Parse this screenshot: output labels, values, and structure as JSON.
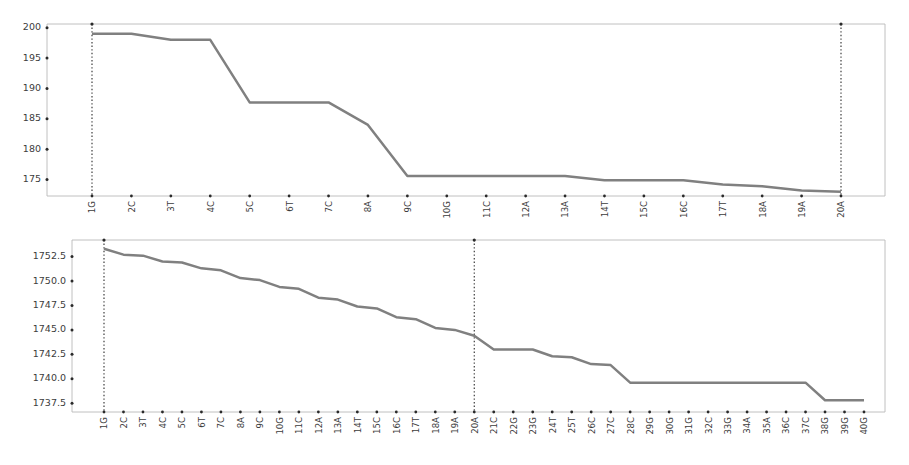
{
  "figure": {
    "background_color": "#ffffff",
    "line_color": "#808080",
    "axis_color": "#b9b9b9",
    "tick_color": "#2a2a2a",
    "marker_line_color": "#2a2a2a"
  },
  "chart_data": [
    {
      "id": "top",
      "type": "line",
      "title": "",
      "xlabel": "",
      "ylabel": "",
      "grid": false,
      "legend": null,
      "ylim": [
        172.3,
        200.6
      ],
      "yticks": [
        175,
        180,
        185,
        190,
        195,
        200
      ],
      "ytick_labels": [
        "175",
        "180",
        "185",
        "190",
        "195",
        "200"
      ],
      "categories": [
        "1G",
        "2C",
        "3T",
        "4C",
        "5C",
        "6T",
        "7C",
        "8A",
        "9C",
        "10G",
        "11C",
        "12A",
        "13A",
        "14T",
        "15C",
        "16C",
        "17T",
        "18A",
        "19A",
        "20A"
      ],
      "values": [
        199.0,
        199.0,
        198.0,
        198.0,
        187.7,
        187.7,
        187.7,
        184.0,
        175.6,
        175.6,
        175.6,
        175.6,
        175.6,
        174.9,
        174.9,
        174.9,
        174.2,
        173.9,
        173.2,
        173.0
      ],
      "vertical_markers": [
        "1G",
        "20A"
      ],
      "x_axis_extends_beyond_last_category": true
    },
    {
      "id": "bottom",
      "type": "line",
      "title": "",
      "xlabel": "",
      "ylabel": "",
      "grid": false,
      "legend": null,
      "ylim": [
        1736.6,
        1754.2
      ],
      "yticks": [
        1737.5,
        1740.0,
        1742.5,
        1745.0,
        1747.5,
        1750.0,
        1752.5
      ],
      "ytick_labels": [
        "1737.5",
        "1740.0",
        "1742.5",
        "1745.0",
        "1747.5",
        "1750.0",
        "1752.5"
      ],
      "categories": [
        "1G",
        "2C",
        "3T",
        "4C",
        "5C",
        "6T",
        "7C",
        "8A",
        "9C",
        "10G",
        "11C",
        "12A",
        "13A",
        "14T",
        "15C",
        "16C",
        "17T",
        "18A",
        "19A",
        "20A",
        "21C",
        "22G",
        "23G",
        "24T",
        "25T",
        "26C",
        "27C",
        "28C",
        "29G",
        "30G",
        "31G",
        "32C",
        "33G",
        "34A",
        "35A",
        "36C",
        "37C",
        "38G",
        "39G",
        "40G"
      ],
      "values": [
        1753.3,
        1752.7,
        1752.6,
        1752.0,
        1751.9,
        1751.3,
        1751.1,
        1750.3,
        1750.1,
        1749.4,
        1749.2,
        1748.3,
        1748.1,
        1747.4,
        1747.2,
        1746.3,
        1746.1,
        1745.2,
        1745.0,
        1744.4,
        1743.0,
        1743.0,
        1743.0,
        1742.3,
        1742.2,
        1741.5,
        1741.4,
        1739.6,
        1739.6,
        1739.6,
        1739.6,
        1739.6,
        1739.6,
        1739.6,
        1739.6,
        1739.6,
        1739.6,
        1737.8,
        1737.8,
        1737.8
      ],
      "vertical_markers": [
        "1G",
        "20A"
      ],
      "x_axis_extends_beyond_last_category": false
    }
  ]
}
